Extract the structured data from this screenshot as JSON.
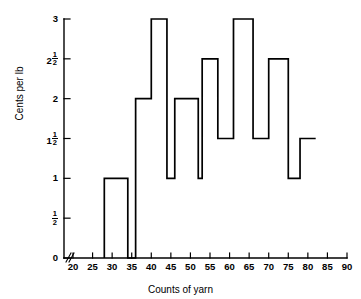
{
  "chart_data": {
    "type": "bar",
    "title": "",
    "xlabel": "Counts of yarn",
    "ylabel": "Cents per lb",
    "xlim": [
      17,
      91
    ],
    "ylim": [
      0,
      3
    ],
    "grid": false,
    "legend": null,
    "x_ticks": [
      20,
      25,
      30,
      35,
      40,
      45,
      50,
      55,
      60,
      65,
      70,
      75,
      80,
      85,
      90
    ],
    "x_tick_labels": [
      "20",
      "25",
      "30",
      "35",
      "40",
      "45",
      "50",
      "55",
      "60",
      "65",
      "70",
      "75",
      "80",
      "85",
      "90"
    ],
    "y_ticks": [
      0,
      0.5,
      1,
      1.5,
      2,
      2.5,
      3
    ],
    "y_tick_labels": [
      "0",
      "1/2",
      "1",
      "1 1/2",
      "2",
      "2 1/2",
      "3"
    ],
    "axis_break": true,
    "steps": [
      {
        "x_start": 28,
        "x_end": 34,
        "value": 1
      },
      {
        "x_start": 34,
        "x_end": 36,
        "value": 0
      },
      {
        "x_start": 36,
        "x_end": 40,
        "value": 2
      },
      {
        "x_start": 40,
        "x_end": 44,
        "value": 3
      },
      {
        "x_start": 44,
        "x_end": 46,
        "value": 1
      },
      {
        "x_start": 46,
        "x_end": 52,
        "value": 2
      },
      {
        "x_start": 52,
        "x_end": 53,
        "value": 1
      },
      {
        "x_start": 53,
        "x_end": 57,
        "value": 2.5
      },
      {
        "x_start": 57,
        "x_end": 61,
        "value": 1.5
      },
      {
        "x_start": 61,
        "x_end": 66,
        "value": 3
      },
      {
        "x_start": 66,
        "x_end": 70,
        "value": 1.5
      },
      {
        "x_start": 70,
        "x_end": 75,
        "value": 2.5
      },
      {
        "x_start": 75,
        "x_end": 78,
        "value": 1
      },
      {
        "x_start": 78,
        "x_end": 82,
        "value": 1.5
      }
    ],
    "line_color": "#000000",
    "background_color": "#ffffff"
  }
}
